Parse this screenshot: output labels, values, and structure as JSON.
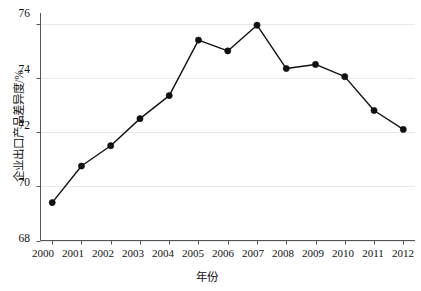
{
  "chart_data": {
    "type": "line",
    "title": "",
    "xlabel": "年份",
    "ylabel": "企业出口产品差异度/%",
    "categories": [
      "2000",
      "2001",
      "2002",
      "2003",
      "2004",
      "2005",
      "2006",
      "2007",
      "2008",
      "2009",
      "2010",
      "2011",
      "2012"
    ],
    "values": [
      69.4,
      70.75,
      71.5,
      72.5,
      73.35,
      75.4,
      75.0,
      75.95,
      74.35,
      74.5,
      74.05,
      72.8,
      72.1
    ],
    "series": [
      {
        "name": "企业出口产品差异度",
        "values": [
          69.4,
          70.75,
          71.5,
          72.5,
          73.35,
          75.4,
          75.0,
          75.95,
          74.35,
          74.5,
          74.05,
          72.8,
          72.1
        ]
      }
    ],
    "x": [
      2000,
      2001,
      2002,
      2003,
      2004,
      2005,
      2006,
      2007,
      2008,
      2009,
      2010,
      2011,
      2012
    ],
    "xlim": [
      1999.6,
      2012.4
    ],
    "ylim": [
      68,
      76.4
    ],
    "ytick_labels": [
      "76",
      "74",
      "72",
      "70",
      "68"
    ],
    "ytick_values": [
      76,
      74,
      72,
      70,
      68
    ],
    "xtick_labels": [
      "2000",
      "2001",
      "2002",
      "2003",
      "2004",
      "2005",
      "2006",
      "2007",
      "2008",
      "2009",
      "2010",
      "2011",
      "2012"
    ],
    "grid": true,
    "grid_axis": "y",
    "legend": false,
    "legend_position": "none",
    "marker": "filled-circle",
    "line_color": "#111111",
    "marker_color": "#111111",
    "grid_color": "#e9e9e9",
    "axis_color": "#555555",
    "background_color": "#ffffff",
    "annotations": []
  }
}
